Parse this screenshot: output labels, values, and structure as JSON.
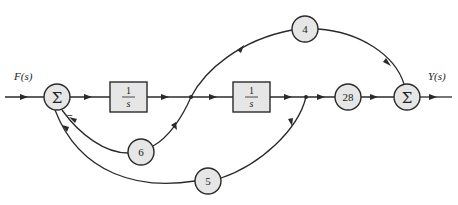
{
  "diagram": {
    "type": "signal-flow block diagram",
    "input_label": "F(s)",
    "output_label": "Y(s)",
    "summing_junctions": [
      {
        "id": "sum1",
        "symbol": "Σ",
        "signs": [
          "+",
          "−",
          "−"
        ]
      },
      {
        "id": "sum2",
        "symbol": "Σ",
        "signs": [
          "+",
          "+"
        ]
      }
    ],
    "blocks": [
      {
        "id": "int1",
        "numerator": "1",
        "denominator": "s"
      },
      {
        "id": "int2",
        "numerator": "1",
        "denominator": "s"
      }
    ],
    "gains": [
      {
        "id": "g4",
        "value": "4",
        "from": "after int1",
        "to": "sum2"
      },
      {
        "id": "g28",
        "value": "28",
        "from": "after int2",
        "to": "sum2"
      },
      {
        "id": "g6",
        "value": "6",
        "from": "after int1",
        "to": "sum1",
        "sign": "−"
      },
      {
        "id": "g5",
        "value": "5",
        "from": "after int2",
        "to": "sum1",
        "sign": "−"
      }
    ],
    "minus_sign": "−",
    "colors": {
      "line": "#2a2a2a",
      "fill": "#e6e6e6",
      "background": "#ffffff"
    }
  }
}
